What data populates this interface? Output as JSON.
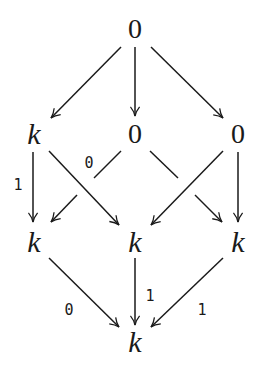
{
  "diagram": {
    "type": "commutative-diagram",
    "nodes": [
      {
        "id": "top",
        "label": "0",
        "style": "upright",
        "x": 135,
        "y": 29
      },
      {
        "id": "mid-left",
        "label": "k",
        "style": "italic",
        "x": 34,
        "y": 134
      },
      {
        "id": "mid-center",
        "label": "0",
        "style": "upright",
        "x": 135,
        "y": 134
      },
      {
        "id": "mid-right",
        "label": "0",
        "style": "upright",
        "x": 238,
        "y": 134
      },
      {
        "id": "low-left",
        "label": "k",
        "style": "italic",
        "x": 34,
        "y": 242
      },
      {
        "id": "low-center",
        "label": "k",
        "style": "italic",
        "x": 135,
        "y": 242
      },
      {
        "id": "low-right",
        "label": "k",
        "style": "italic",
        "x": 238,
        "y": 242
      },
      {
        "id": "bottom",
        "label": "k",
        "style": "italic",
        "x": 135,
        "y": 342
      }
    ],
    "edges": [
      {
        "from": "top",
        "to": "mid-left",
        "label": ""
      },
      {
        "from": "top",
        "to": "mid-center",
        "label": ""
      },
      {
        "from": "top",
        "to": "mid-right",
        "label": ""
      },
      {
        "from": "mid-left",
        "to": "low-left",
        "label": "1"
      },
      {
        "from": "mid-left",
        "to": "low-center",
        "label": ""
      },
      {
        "from": "mid-center",
        "to": "low-left",
        "label": "0"
      },
      {
        "from": "mid-center",
        "to": "low-right",
        "label": ""
      },
      {
        "from": "mid-right",
        "to": "low-center",
        "label": ""
      },
      {
        "from": "mid-right",
        "to": "low-right",
        "label": ""
      },
      {
        "from": "low-left",
        "to": "bottom",
        "label": "0"
      },
      {
        "from": "low-center",
        "to": "bottom",
        "label": "1"
      },
      {
        "from": "low-right",
        "to": "bottom",
        "label": "1"
      }
    ],
    "edge_labels": [
      {
        "text": "1",
        "x": 18,
        "y": 185
      },
      {
        "text": "0",
        "x": 89,
        "y": 163
      },
      {
        "text": "0",
        "x": 69,
        "y": 310
      },
      {
        "text": "1",
        "x": 150,
        "y": 296
      },
      {
        "text": "1",
        "x": 202,
        "y": 310
      }
    ]
  }
}
